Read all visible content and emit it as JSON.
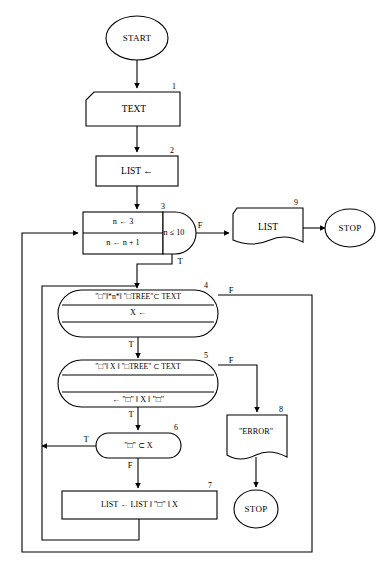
{
  "diagram": {
    "stroke_color": "#000000",
    "fill_color": "#ffffff",
    "background_color": "#ffffff"
  },
  "terminators": {
    "start": "START",
    "stop_main": "STOP",
    "stop_error": "STOP"
  },
  "nodes": [
    {
      "id": "1",
      "number": "1",
      "shape": "input",
      "label": "TEXT"
    },
    {
      "id": "2",
      "number": "2",
      "shape": "process",
      "label": "LIST ←"
    },
    {
      "id": "3",
      "number": "3",
      "shape": "loop",
      "init": "n ← 3",
      "increment": "n ← n + 1",
      "condition": "n ≤ 10",
      "true_label": "T",
      "false_label": "F"
    },
    {
      "id": "4",
      "number": "4",
      "shape": "stadium",
      "row1": "\"□\"‖*n*‖ \"□TREE\"⊂ TEXT",
      "row2": "X ←",
      "row3": "",
      "true_label": "T",
      "false_label": "F"
    },
    {
      "id": "5",
      "number": "5",
      "shape": "stadium",
      "row1": "\"□\"‖ X ‖ \"□TREE\" ⊂ TEXT",
      "row2": "",
      "row3": "← \"□\" ‖ X ‖ \"□\"",
      "true_label": "T",
      "false_label": "F"
    },
    {
      "id": "6",
      "number": "6",
      "shape": "stadium",
      "label": "\"□\" ⊂ X",
      "true_label": "T",
      "false_label": "F"
    },
    {
      "id": "7",
      "number": "7",
      "shape": "process",
      "label": "LIST ← LIST ‖ \"□\" ‖ X"
    },
    {
      "id": "8",
      "number": "8",
      "shape": "document",
      "label": "\"ERROR\""
    },
    {
      "id": "9",
      "number": "9",
      "shape": "document",
      "label": "LIST"
    }
  ]
}
